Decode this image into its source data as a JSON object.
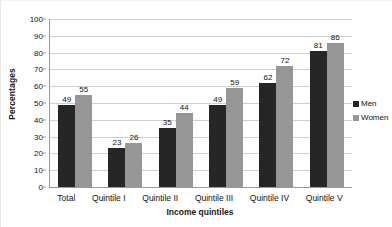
{
  "chart_data": {
    "type": "bar",
    "title": "",
    "xlabel": "Income quintiles",
    "ylabel": "Percentages",
    "categories": [
      "Total",
      "Quintile I",
      "Quintile II",
      "Quintile III",
      "Quintile IV",
      "Quintile V"
    ],
    "series": [
      {
        "name": "Men",
        "color": "#262626",
        "values": [
          49,
          23,
          35,
          49,
          62,
          81
        ]
      },
      {
        "name": "Women",
        "color": "#969696",
        "values": [
          55,
          26,
          44,
          59,
          72,
          86
        ]
      }
    ],
    "ylim": [
      0,
      100
    ],
    "yticks": [
      0,
      10,
      20,
      30,
      40,
      50,
      60,
      70,
      80,
      90,
      100
    ],
    "ytick_labels": [
      "0",
      "10",
      "20",
      "30",
      "40",
      "50",
      "60",
      "70",
      "80",
      "90",
      "100"
    ],
    "grid": true,
    "grid_axis": "y",
    "legend_position": "right",
    "data_labels": true
  },
  "legend": {
    "items": [
      {
        "label": "Men",
        "swatch": "men"
      },
      {
        "label": "Women",
        "swatch": "women"
      }
    ]
  },
  "colors": {
    "men": "#262626",
    "women": "#969696",
    "gridline": "#cfcfcf",
    "axis": "#9a9a9a",
    "text": "#111111"
  }
}
